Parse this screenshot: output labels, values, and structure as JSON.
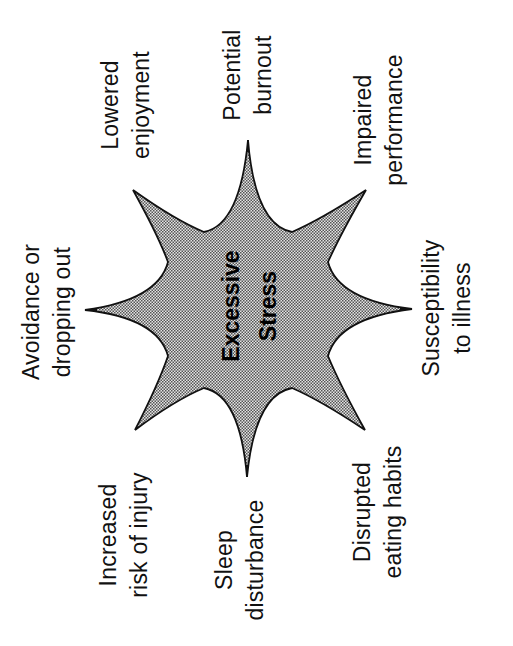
{
  "diagram": {
    "type": "radial-star",
    "orientation": "rotated -90 degrees",
    "center": {
      "line1": "Excessive",
      "line2": "Stress"
    },
    "colors": {
      "star_fill": "#c8c8c8",
      "star_stroke": "#111111",
      "text": "#111111",
      "background": "#ffffff"
    },
    "consequences": [
      {
        "id": "lowered-enjoyment",
        "line1": "Lowered",
        "line2": "enjoyment"
      },
      {
        "id": "potential-burnout",
        "line1": "Potential",
        "line2": "burnout"
      },
      {
        "id": "impaired-performance",
        "line1": "Impaired",
        "line2": "performance"
      },
      {
        "id": "avoidance",
        "line1": "Avoidance or",
        "line2": "dropping out"
      },
      {
        "id": "susceptibility",
        "line1": "Susceptibility",
        "line2": "to illness"
      },
      {
        "id": "injury-risk",
        "line1": "Increased",
        "line2": "risk of injury"
      },
      {
        "id": "sleep",
        "line1": "Sleep",
        "line2": "disturbance"
      },
      {
        "id": "eating",
        "line1": "Disrupted",
        "line2": "eating habits"
      }
    ]
  }
}
